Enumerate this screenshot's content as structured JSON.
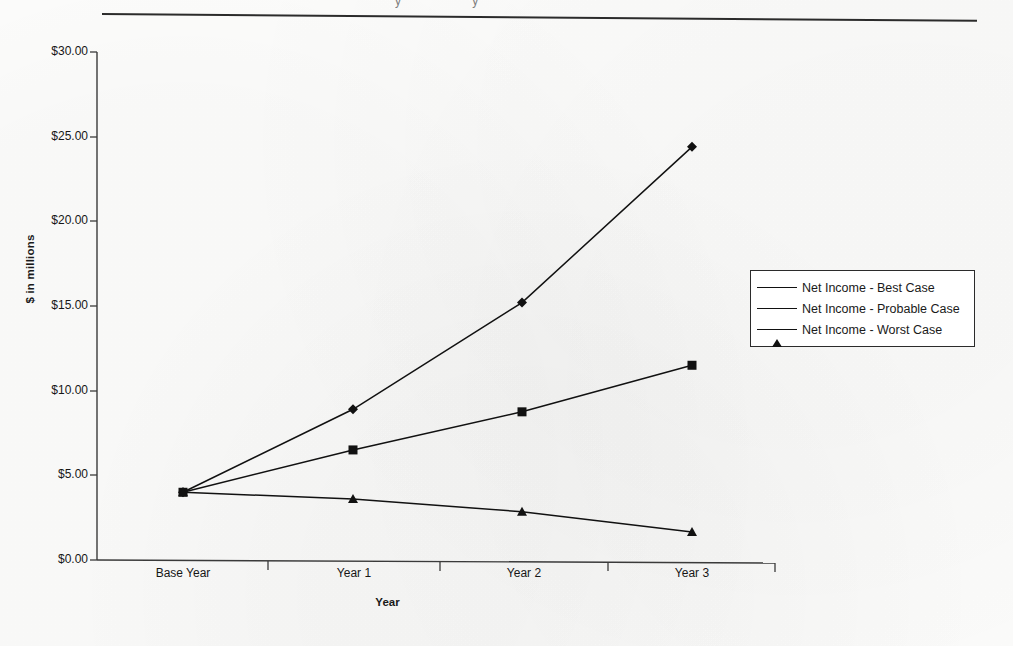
{
  "page": {
    "cut_text_fragment": "y   y",
    "has_horizontal_rule": true,
    "background_color": "#fdfdfc",
    "ink_color": "#1a1a1a"
  },
  "chart_data": {
    "type": "line",
    "title": "",
    "xlabel": "Year",
    "ylabel": "$ in millions",
    "categories": [
      "Base Year",
      "Year 1",
      "Year 2",
      "Year 3"
    ],
    "ylim": [
      0,
      30
    ],
    "ytick_labels": [
      "$0.00",
      "$5.00",
      "$10.00",
      "$15.00",
      "$20.00",
      "$25.00",
      "$30.00"
    ],
    "ytick_values": [
      0,
      5,
      10,
      15,
      20,
      25,
      30
    ],
    "grid": false,
    "legend_position": "right",
    "series": [
      {
        "name": "Net Income - Best Case",
        "marker": "diamond",
        "values": [
          4.0,
          8.9,
          15.2,
          24.4
        ]
      },
      {
        "name": "Net Income - Probable Case",
        "marker": "square",
        "values": [
          4.0,
          6.5,
          8.75,
          11.5
        ]
      },
      {
        "name": "Net Income - Worst Case",
        "marker": "triangle",
        "values": [
          4.0,
          3.6,
          2.85,
          1.65
        ]
      }
    ]
  },
  "axes": {
    "y_axis_name": "y-axis",
    "x_axis_name": "x-axis"
  }
}
